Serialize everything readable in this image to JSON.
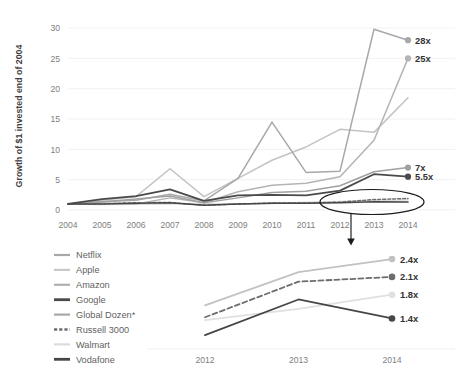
{
  "chart_data": [
    {
      "id": "main",
      "type": "line",
      "title": "",
      "xlabel": "",
      "ylabel": "Growth of $1 invested end of 2004",
      "x": [
        2004,
        2005,
        2006,
        2007,
        2008,
        2009,
        2010,
        2011,
        2012,
        2013,
        2014
      ],
      "xticklabels": [
        "2004",
        "2005",
        "2006",
        "2007",
        "2008",
        "2009",
        "2010",
        "2011",
        "2012",
        "2013",
        "2014"
      ],
      "yticklabels": [
        "0",
        "5",
        "10",
        "15",
        "20",
        "25",
        "30"
      ],
      "ytickvalues": [
        0,
        5,
        10,
        15,
        20,
        25,
        30
      ],
      "ylim": [
        0,
        31
      ],
      "xlim": [
        2004,
        2014
      ],
      "grid": true,
      "legend_position": "bottom-left",
      "series": [
        {
          "name": "Netflix",
          "color": "#a8a8a8",
          "width": 1.5,
          "dash": "none",
          "values": [
            1,
            1.4,
            1.6,
            2.6,
            1.5,
            5.2,
            14.5,
            6.2,
            6.4,
            29.8,
            28
          ],
          "end_label": "28x"
        },
        {
          "name": "Amazon",
          "color": "#b4b4b4",
          "width": 1.5,
          "dash": "none",
          "values": [
            1,
            1.1,
            1.0,
            2.0,
            1.2,
            3.0,
            4.1,
            4.4,
            5.5,
            11.5,
            25
          ],
          "end_label": "25x"
        },
        {
          "name": "Apple",
          "color": "#c3c3c3",
          "width": 1.5,
          "dash": "none",
          "values": [
            1,
            1.6,
            2.2,
            6.8,
            2.2,
            5.2,
            8.2,
            10.4,
            13.3,
            12.8,
            18.5
          ],
          "end_label": ""
        },
        {
          "name": "Global Dozen*",
          "color": "#a0a0a0",
          "width": 1.5,
          "dash": "none",
          "values": [
            1,
            1.3,
            1.8,
            2.3,
            1.2,
            2.0,
            2.9,
            3.1,
            4.0,
            6.3,
            7
          ],
          "end_label": "7x"
        },
        {
          "name": "Google",
          "color": "#4a4a4a",
          "width": 1.8,
          "dash": "none",
          "values": [
            1,
            1.8,
            2.3,
            3.4,
            1.5,
            2.4,
            2.5,
            2.4,
            3.2,
            5.9,
            5.5
          ],
          "end_label": "5.5x"
        },
        {
          "name": "Russell 3000",
          "color": "#6d6d6d",
          "width": 1.4,
          "dash": "3,2",
          "values": [
            1,
            1.05,
            1.2,
            1.25,
            0.78,
            0.98,
            1.15,
            1.15,
            1.3,
            1.72,
            1.9
          ],
          "end_label": ""
        },
        {
          "name": "Walmart",
          "color": "#dadada",
          "width": 1.4,
          "dash": "none",
          "values": [
            1,
            0.9,
            0.95,
            1.0,
            1.05,
            1.0,
            1.05,
            1.3,
            1.4,
            1.55,
            1.7
          ],
          "end_label": ""
        },
        {
          "name": "Vodafone",
          "color": "#464646",
          "width": 1.5,
          "dash": "none",
          "values": [
            1,
            1.0,
            1.1,
            1.2,
            0.8,
            1.0,
            1.1,
            1.1,
            1.2,
            1.35,
            1.3
          ],
          "end_label": ""
        }
      ],
      "annotation": {
        "ellipse_label": "highlight-ellipse-2012-2014",
        "arrow_label": "zoom-arrow"
      }
    },
    {
      "id": "inset",
      "type": "line",
      "title": "",
      "xlabel": "",
      "ylabel": "",
      "x": [
        2012,
        2013,
        2014
      ],
      "xticklabels": [
        "2012",
        "2013",
        "2014"
      ],
      "ylim": [
        1.0,
        2.6
      ],
      "grid": false,
      "series": [
        {
          "name": "Global Dozen*",
          "color": "#c2c2c2",
          "width": 1.8,
          "dash": "none",
          "values": [
            1.62,
            2.18,
            2.4
          ],
          "end_label": "2.4x"
        },
        {
          "name": "Russell 3000",
          "color": "#6d6d6d",
          "width": 1.8,
          "dash": "5,3",
          "values": [
            1.42,
            2.02,
            2.1
          ],
          "end_label": "2.1x"
        },
        {
          "name": "Walmart",
          "color": "#e0e0e0",
          "width": 1.8,
          "dash": "none",
          "values": [
            1.37,
            1.56,
            1.8
          ],
          "end_label": "1.8x"
        },
        {
          "name": "Vodafone",
          "color": "#464646",
          "width": 1.8,
          "dash": "none",
          "values": [
            1.12,
            1.72,
            1.4
          ],
          "end_label": "1.4x"
        }
      ]
    }
  ],
  "main": {
    "ylabel": "Growth of $1 invested end of 2004",
    "yticks": [
      "30",
      "25",
      "20",
      "15",
      "10",
      "5",
      "0"
    ],
    "xticks": [
      "2004",
      "2005",
      "2006",
      "2007",
      "2008",
      "2009",
      "2010",
      "2011",
      "2012",
      "2013",
      "2014"
    ],
    "endlabels": [
      "28x",
      "25x",
      "7x",
      "5.5x"
    ]
  },
  "inset": {
    "xticks": [
      "2012",
      "2013",
      "2014"
    ],
    "endlabels": [
      "2.4x",
      "2.1x",
      "1.8x",
      "1.4x"
    ]
  },
  "legend": {
    "items": [
      {
        "label": "Netflix",
        "color": "#a8a8a8",
        "width": 2.2,
        "dash": "none"
      },
      {
        "label": "Apple",
        "color": "#c8c8c8",
        "width": 2.2,
        "dash": "none"
      },
      {
        "label": "Amazon",
        "color": "#b0b0b0",
        "width": 2.2,
        "dash": "none"
      },
      {
        "label": "Google",
        "color": "#4a4a4a",
        "width": 2.8,
        "dash": "none"
      },
      {
        "label": "Global Dozen*",
        "color": "#a8a8a8",
        "width": 2.2,
        "dash": "none"
      },
      {
        "label": "Russell 3000",
        "color": "#6d6d6d",
        "width": 2.4,
        "dash": "3.2,2"
      },
      {
        "label": "Walmart",
        "color": "#dcdcdc",
        "width": 2.2,
        "dash": "none"
      },
      {
        "label": "Vodafone",
        "color": "#464646",
        "width": 2.8,
        "dash": "none"
      }
    ]
  }
}
